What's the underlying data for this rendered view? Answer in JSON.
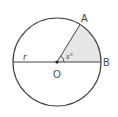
{
  "diagram": {
    "type": "circle-sector",
    "center": {
      "label": "O",
      "x": 57,
      "y": 62
    },
    "radius_px": 44,
    "radius_label": "r",
    "points": [
      {
        "label": "A",
        "x": 80,
        "y": 25
      },
      {
        "label": "B",
        "x": 101,
        "y": 62
      }
    ],
    "angle_label": "x°",
    "angle_degrees": 58,
    "colors": {
      "stroke": "#444444",
      "sector_fill": "#e6e6e6",
      "background": "#ffffff"
    }
  }
}
